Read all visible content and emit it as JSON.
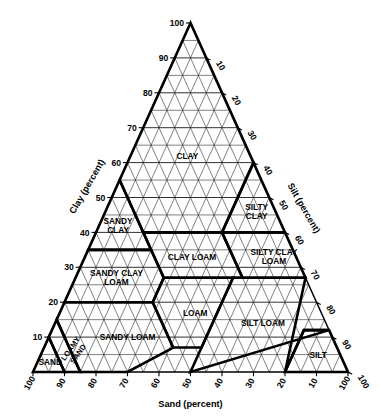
{
  "axes": {
    "left": {
      "name": "clay-axis",
      "title": "Clay (percent)",
      "ticks": [
        10,
        20,
        30,
        40,
        50,
        60,
        70,
        80,
        90,
        100
      ]
    },
    "right": {
      "name": "silt-axis",
      "title": "Silt (percent)",
      "ticks": [
        10,
        20,
        30,
        40,
        50,
        60,
        70,
        80,
        90,
        100
      ]
    },
    "bottom": {
      "name": "sand-axis",
      "title": "Sand (percent)",
      "ticks": [
        100,
        90,
        80,
        70,
        60,
        50,
        40,
        30,
        20,
        10,
        100
      ]
    }
  },
  "grid": {
    "interval": 5,
    "divisions": 20,
    "major_interval": 10,
    "visible": true
  },
  "colors": {
    "line": "#1a1a1a",
    "boundary": "#000000",
    "background": "#ffffff",
    "text": "#000000"
  },
  "chart_data": {
    "type": "ternary",
    "xlabel": "Sand (percent)",
    "ylabel": "Clay (percent)",
    "zlabel": "Silt (percent)",
    "axis_range": [
      0,
      100
    ],
    "tick_interval": 10,
    "grid": true,
    "legend": "none",
    "classes": [
      {
        "name": "clay",
        "label": "CLAY",
        "label_lines": [
          "CLAY"
        ],
        "centroid": {
          "clay": 62,
          "sand": 20,
          "silt": 18
        },
        "vertices": [
          {
            "clay": 100,
            "sand": 0,
            "silt": 0
          },
          {
            "clay": 55,
            "sand": 45,
            "silt": 0
          },
          {
            "clay": 40,
            "sand": 45,
            "silt": 15
          },
          {
            "clay": 40,
            "sand": 20,
            "silt": 40
          },
          {
            "clay": 60,
            "sand": 0,
            "silt": 40
          }
        ]
      },
      {
        "name": "silty-clay",
        "label": "SILTY CLAY",
        "label_lines": [
          "SILTY",
          "CLAY"
        ],
        "centroid": {
          "clay": 46,
          "sand": 6,
          "silt": 48
        },
        "vertices": [
          {
            "clay": 60,
            "sand": 0,
            "silt": 40
          },
          {
            "clay": 40,
            "sand": 20,
            "silt": 40
          },
          {
            "clay": 40,
            "sand": 0,
            "silt": 60
          }
        ]
      },
      {
        "name": "silty-clay-loam",
        "label": "SILTY CLAY LOAM",
        "label_lines": [
          "SILTY CLAY",
          "LOAM"
        ],
        "centroid": {
          "clay": 33,
          "sand": 7,
          "silt": 60
        },
        "vertices": [
          {
            "clay": 40,
            "sand": 20,
            "silt": 40
          },
          {
            "clay": 27,
            "sand": 20,
            "silt": 53
          },
          {
            "clay": 27,
            "sand": 0,
            "silt": 73
          },
          {
            "clay": 40,
            "sand": 0,
            "silt": 60
          }
        ]
      },
      {
        "name": "sandy-clay",
        "label": "SANDY CLAY",
        "label_lines": [
          "SANDY",
          "CLAY"
        ],
        "centroid": {
          "clay": 42,
          "sand": 52,
          "silt": 6
        },
        "vertices": [
          {
            "clay": 55,
            "sand": 45,
            "silt": 0
          },
          {
            "clay": 35,
            "sand": 65,
            "silt": 0
          },
          {
            "clay": 35,
            "sand": 45,
            "silt": 20
          },
          {
            "clay": 40,
            "sand": 45,
            "silt": 15
          }
        ]
      },
      {
        "name": "clay-loam",
        "label": "CLAY LOAM",
        "label_lines": [
          "CLAY LOAM"
        ],
        "centroid": {
          "clay": 33,
          "sand": 33,
          "silt": 34
        },
        "vertices": [
          {
            "clay": 40,
            "sand": 45,
            "silt": 15
          },
          {
            "clay": 40,
            "sand": 20,
            "silt": 40
          },
          {
            "clay": 27,
            "sand": 20,
            "silt": 53
          },
          {
            "clay": 27,
            "sand": 45,
            "silt": 28
          }
        ]
      },
      {
        "name": "sandy-clay-loam",
        "label": "SANDY CLAY LOAM",
        "label_lines": [
          "SANDY CLAY",
          "LOAM"
        ],
        "centroid": {
          "clay": 27,
          "sand": 60,
          "silt": 13
        },
        "vertices": [
          {
            "clay": 35,
            "sand": 65,
            "silt": 0
          },
          {
            "clay": 20,
            "sand": 80,
            "silt": 0
          },
          {
            "clay": 20,
            "sand": 52,
            "silt": 28
          },
          {
            "clay": 27,
            "sand": 45,
            "silt": 28
          },
          {
            "clay": 35,
            "sand": 45,
            "silt": 20
          }
        ]
      },
      {
        "name": "loam",
        "label": "LOAM",
        "label_lines": [
          "LOAM"
        ],
        "centroid": {
          "clay": 17,
          "sand": 40,
          "silt": 43
        },
        "vertices": [
          {
            "clay": 27,
            "sand": 45,
            "silt": 28
          },
          {
            "clay": 20,
            "sand": 52,
            "silt": 28
          },
          {
            "clay": 7,
            "sand": 52,
            "silt": 41
          },
          {
            "clay": 7,
            "sand": 43,
            "silt": 50
          },
          {
            "clay": 27,
            "sand": 23,
            "silt": 50
          }
        ]
      },
      {
        "name": "silt-loam",
        "label": "SILT LOAM",
        "label_lines": [
          "SILT LOAM"
        ],
        "centroid": {
          "clay": 14,
          "sand": 20,
          "silt": 66
        },
        "vertices": [
          {
            "clay": 27,
            "sand": 23,
            "silt": 50
          },
          {
            "clay": 27,
            "sand": 0,
            "silt": 73
          },
          {
            "clay": 0,
            "sand": 20,
            "silt": 80
          },
          {
            "clay": 12,
            "sand": 8,
            "silt": 80
          },
          {
            "clay": 12,
            "sand": 0,
            "silt": 88
          },
          {
            "clay": 0,
            "sand": 50,
            "silt": 50
          },
          {
            "clay": 7,
            "sand": 43,
            "silt": 50
          }
        ]
      },
      {
        "name": "silt",
        "label": "SILT",
        "label_lines": [
          "SILT"
        ],
        "centroid": {
          "clay": 5,
          "sand": 7,
          "silt": 88
        },
        "vertices": [
          {
            "clay": 12,
            "sand": 0,
            "silt": 88
          },
          {
            "clay": 12,
            "sand": 8,
            "silt": 80
          },
          {
            "clay": 0,
            "sand": 20,
            "silt": 80
          },
          {
            "clay": 0,
            "sand": 0,
            "silt": 100
          }
        ]
      },
      {
        "name": "sandy-loam",
        "label": "SANDY LOAM",
        "label_lines": [
          "SANDY LOAM"
        ],
        "centroid": {
          "clay": 10,
          "sand": 65,
          "silt": 25
        },
        "vertices": [
          {
            "clay": 20,
            "sand": 80,
            "silt": 0
          },
          {
            "clay": 20,
            "sand": 52,
            "silt": 28
          },
          {
            "clay": 7,
            "sand": 52,
            "silt": 41
          },
          {
            "clay": 0,
            "sand": 70,
            "silt": 30
          },
          {
            "clay": 0,
            "sand": 85,
            "silt": 15
          },
          {
            "clay": 15,
            "sand": 85,
            "silt": 0
          }
        ]
      },
      {
        "name": "loamy-sand",
        "label": "LOAMY SAND",
        "label_lines": [
          "LOAMY",
          "SAND"
        ],
        "rotated": true,
        "centroid": {
          "clay": 6,
          "sand": 84,
          "silt": 10
        },
        "vertices": [
          {
            "clay": 15,
            "sand": 85,
            "silt": 0
          },
          {
            "clay": 0,
            "sand": 85,
            "silt": 15
          },
          {
            "clay": 0,
            "sand": 90,
            "silt": 10
          },
          {
            "clay": 10,
            "sand": 90,
            "silt": 0
          }
        ]
      },
      {
        "name": "sand",
        "label": "SAND",
        "label_lines": [
          "SAND"
        ],
        "centroid": {
          "clay": 3,
          "sand": 93,
          "silt": 4
        },
        "vertices": [
          {
            "clay": 10,
            "sand": 90,
            "silt": 0
          },
          {
            "clay": 0,
            "sand": 90,
            "silt": 10
          },
          {
            "clay": 0,
            "sand": 100,
            "silt": 0
          }
        ]
      }
    ]
  }
}
